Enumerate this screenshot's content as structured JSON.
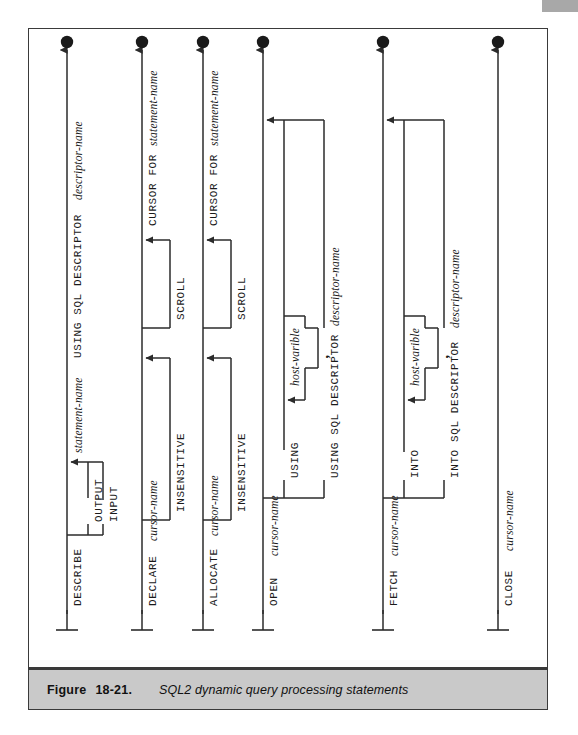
{
  "caption": {
    "label": "Figure",
    "number": "18-21.",
    "text": "SQL2 dynamic query processing statements"
  },
  "diagram": {
    "type": "railroad-syntax-diagram",
    "orientation": "vertical-bottom-to-top",
    "line_color": "#2b2b2b",
    "branches": [
      {
        "id": "describe",
        "keyword": "DESCRIBE",
        "tail": "statement-name USING SQL DESCRIPTOR descriptor-name",
        "options": [
          "OUTPUT",
          "INPUT"
        ]
      },
      {
        "id": "declare",
        "keyword": "DECLARE cursor-name",
        "tail": "CURSOR FOR statement-name",
        "options": [
          "INSENSITIVE",
          "SCROLL"
        ]
      },
      {
        "id": "allocate",
        "keyword": "ALLOCATE cursor-name",
        "tail": "CURSOR FOR statement-name",
        "options": [
          "INSENSITIVE",
          "SCROLL"
        ]
      },
      {
        "id": "open",
        "keyword": "OPEN cursor-name",
        "tail": "",
        "options": [
          "USING",
          "USING SQL DESCRIPTOR descriptor-name"
        ],
        "list_item": "host-varible",
        "separator": ","
      },
      {
        "id": "fetch",
        "keyword": "FETCH cursor-name",
        "tail": "",
        "options": [
          "INTO",
          "INTO SQL DESCRIPTOR descriptor-name"
        ],
        "list_item": "host-varible",
        "separator": ","
      },
      {
        "id": "close",
        "keyword": "CLOSE cursor-name",
        "tail": "",
        "options": []
      }
    ],
    "labels": {
      "describe_kw": "DESCRIBE",
      "describe_output": "OUTPUT",
      "describe_input": "INPUT",
      "describe_tail": "statement-name",
      "describe_tail2": "USING SQL DESCRIPTOR",
      "describe_tail3": "descriptor-name",
      "declare_kw": "DECLARE",
      "declare_cursor": "cursor-name",
      "declare_insensitive": "INSENSITIVE",
      "declare_scroll": "SCROLL",
      "declare_cursorfor": "CURSOR FOR",
      "declare_stmt": "statement-name",
      "allocate_kw": "ALLOCATE",
      "allocate_cursor": "cursor-name",
      "allocate_insensitive": "INSENSITIVE",
      "allocate_scroll": "SCROLL",
      "allocate_cursorfor": "CURSOR FOR",
      "allocate_stmt": "statement-name",
      "open_kw": "OPEN",
      "open_cursor": "cursor-name",
      "open_using": "USING",
      "open_hostvar": "host-varible",
      "open_comma": ",",
      "open_usingdesc": "USING SQL DESCRIPTOR",
      "open_descname": "descriptor-name",
      "fetch_kw": "FETCH",
      "fetch_cursor": "cursor-name",
      "fetch_into": "INTO",
      "fetch_hostvar": "host-varible",
      "fetch_comma": ",",
      "fetch_intodesc": "INTO SQL DESCRIPTOR",
      "fetch_descname": "descriptor-name",
      "close_kw": "CLOSE",
      "close_cursor": "cursor-name"
    }
  }
}
